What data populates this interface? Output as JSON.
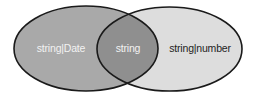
{
  "diagram": {
    "type": "venn",
    "sets": [
      {
        "id": "left",
        "label": "string|Date",
        "fill": "#a9a9a9",
        "stroke": "#1a1a1a",
        "label_color": "#f2f2f2"
      },
      {
        "id": "right",
        "label": "string|number",
        "fill": "#dddddd",
        "stroke": "#1a1a1a",
        "label_color": "#1e1e1e"
      }
    ],
    "intersection": {
      "label": "string",
      "fill": "#8f8f8f",
      "label_color": "#f2f2f2"
    },
    "background": "#ffffff"
  }
}
